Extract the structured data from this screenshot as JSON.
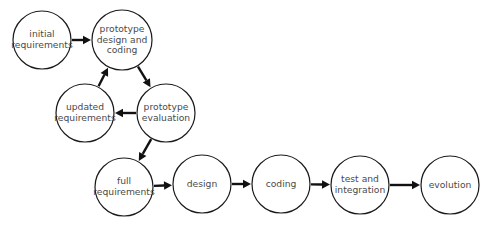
{
  "diagram": {
    "type": "flowchart",
    "nodes": [
      {
        "id": "initial",
        "lines": [
          "initial",
          "requirements"
        ],
        "cx": 42,
        "cy": 40,
        "r": 29
      },
      {
        "id": "proto_design",
        "lines": [
          "prototype",
          "design and",
          "coding"
        ],
        "cx": 122,
        "cy": 40,
        "r": 30
      },
      {
        "id": "proto_eval",
        "lines": [
          "prototype",
          "evaluation"
        ],
        "cx": 166,
        "cy": 113,
        "r": 29
      },
      {
        "id": "updated",
        "lines": [
          "updated",
          "requirements"
        ],
        "cx": 85,
        "cy": 113,
        "r": 29
      },
      {
        "id": "full",
        "lines": [
          "full",
          "requirements"
        ],
        "cx": 124,
        "cy": 187,
        "r": 29
      },
      {
        "id": "design",
        "lines": [
          "design"
        ],
        "cx": 202,
        "cy": 184,
        "r": 29
      },
      {
        "id": "coding",
        "lines": [
          "coding"
        ],
        "cx": 281,
        "cy": 184,
        "r": 29
      },
      {
        "id": "test",
        "lines": [
          "test and",
          "integration"
        ],
        "cx": 360,
        "cy": 185,
        "r": 29
      },
      {
        "id": "evolution",
        "lines": [
          "evolution"
        ],
        "cx": 450,
        "cy": 185,
        "r": 29
      }
    ],
    "edges": [
      {
        "from": "initial",
        "to": "proto_design"
      },
      {
        "from": "proto_design",
        "to": "proto_eval"
      },
      {
        "from": "proto_eval",
        "to": "updated"
      },
      {
        "from": "updated",
        "to": "proto_design"
      },
      {
        "from": "proto_eval",
        "to": "full"
      },
      {
        "from": "full",
        "to": "design"
      },
      {
        "from": "design",
        "to": "coding"
      },
      {
        "from": "coding",
        "to": "test"
      },
      {
        "from": "test",
        "to": "evolution"
      }
    ]
  }
}
